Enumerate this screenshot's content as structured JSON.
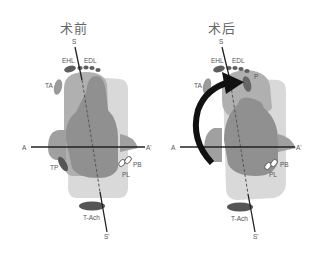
{
  "panels": [
    {
      "title": "术前",
      "labels": {
        "s_top": "S",
        "s_bottom": "S'",
        "a_left": "A",
        "a_right": "A'",
        "ehl": "EHL",
        "edl": "EDL",
        "ta": "TA",
        "tp": "TP",
        "pb": "PB",
        "pl": "PL",
        "tach": "T-Ach"
      }
    },
    {
      "title": "术后",
      "labels": {
        "s_top": "S",
        "s_bottom": "S'",
        "a_left": "A",
        "a_right": "A'",
        "ehl": "EHL",
        "edl": "EDL",
        "ta": "TA",
        "p": "P",
        "pb": "PB",
        "pl": "PL",
        "tach": "T-Ach"
      },
      "arrow": "curved-rotation-arrow"
    }
  ],
  "colors": {
    "light_gray": "#d6d6d6",
    "mid_gray": "#a9a9a9",
    "dark_gray": "#8c8c8c",
    "tendon": "#666666",
    "line": "#222222"
  }
}
